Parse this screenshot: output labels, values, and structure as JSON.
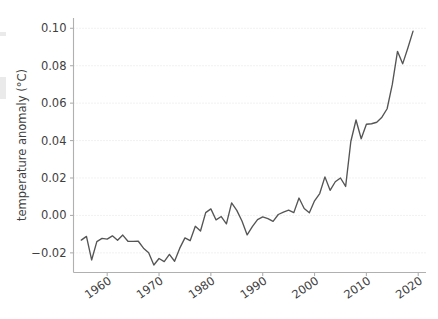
{
  "figure": {
    "background_color": "#ffffff",
    "line_color": "#555555",
    "grid_color": "#dcdcdc",
    "spine_color": "#b0b0b0",
    "text_color": "#3f3f3f"
  },
  "axes": {
    "ylabel": "temperature anomaly (°C)",
    "xlabel": "",
    "ytick_labels": [
      "0.10",
      "0.08",
      "0.06",
      "0.04",
      "0.02",
      "0.00",
      "−0.02"
    ],
    "ytick_values": [
      0.1,
      0.08,
      0.06,
      0.04,
      0.02,
      0.0,
      -0.02
    ],
    "xtick_labels": [
      "1960",
      "1970",
      "1980",
      "1990",
      "2000",
      "2010",
      "2020"
    ],
    "xtick_values": [
      1960,
      1970,
      1980,
      1990,
      2000,
      2010,
      2020
    ],
    "xtick_rotation_deg": 35
  },
  "chart_data": {
    "type": "line",
    "title": "",
    "xlabel": "",
    "ylabel": "temperature anomaly (°C)",
    "xlim": [
      1953.5,
      2021.5
    ],
    "ylim": [
      -0.0305,
      0.1055
    ],
    "grid": true,
    "legend": null,
    "series": [
      {
        "name": "temperature anomaly",
        "color": "#555555",
        "x": [
          1955,
          1956,
          1957,
          1958,
          1959,
          1960,
          1961,
          1962,
          1963,
          1964,
          1965,
          1966,
          1967,
          1968,
          1969,
          1970,
          1971,
          1972,
          1973,
          1974,
          1975,
          1976,
          1977,
          1978,
          1979,
          1980,
          1981,
          1982,
          1983,
          1984,
          1985,
          1986,
          1987,
          1988,
          1989,
          1990,
          1991,
          1992,
          1993,
          1994,
          1995,
          1996,
          1997,
          1998,
          1999,
          2000,
          2001,
          2002,
          2003,
          2004,
          2005,
          2006,
          2007,
          2008,
          2009,
          2010,
          2011,
          2012,
          2013,
          2014,
          2015,
          2016,
          2017,
          2018,
          2019
        ],
        "values": [
          -0.0132,
          -0.0112,
          -0.0238,
          -0.014,
          -0.0123,
          -0.0127,
          -0.0109,
          -0.0133,
          -0.0105,
          -0.0138,
          -0.0139,
          -0.0138,
          -0.0175,
          -0.02,
          -0.0265,
          -0.023,
          -0.0247,
          -0.0208,
          -0.0245,
          -0.0175,
          -0.012,
          -0.0135,
          -0.0058,
          -0.0083,
          0.0015,
          0.0035,
          -0.0024,
          -0.0006,
          -0.0045,
          0.0067,
          0.0027,
          -0.003,
          -0.0104,
          -0.006,
          -0.0022,
          -0.0008,
          -0.0017,
          -0.0032,
          0.0005,
          0.0018,
          0.0028,
          0.0015,
          0.0093,
          0.0037,
          0.0014,
          0.0078,
          0.0117,
          0.0206,
          0.0134,
          0.018,
          0.02,
          0.0155,
          0.0395,
          0.051,
          0.041,
          0.0487,
          0.049,
          0.0498,
          0.0525,
          0.057,
          0.07,
          0.0877,
          0.081,
          0.0895,
          0.0985
        ]
      }
    ]
  }
}
